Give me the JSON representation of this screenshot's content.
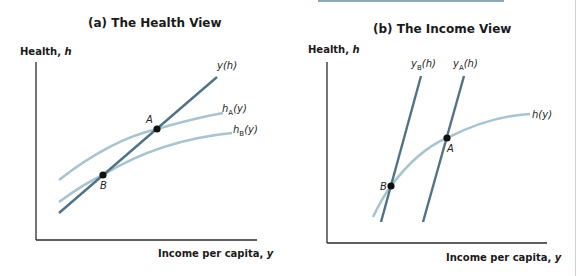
{
  "panel_a": {
    "title": "(a) The Health View",
    "y_axis_label": "Health, ",
    "y_axis_var": "h",
    "x_axis_label": "Income per capita, ",
    "x_axis_var": "y",
    "curves": {
      "y_of_h": {
        "label": "y(h)",
        "color": "#4f7385"
      },
      "h_A": {
        "label": "h",
        "sub": "A",
        "arg": "(y)",
        "color": "#a9c4cf"
      },
      "h_B": {
        "label": "h",
        "sub": "B",
        "arg": "(y)",
        "color": "#a9c4cf"
      }
    },
    "points": {
      "A": "A",
      "B": "B"
    }
  },
  "panel_b": {
    "title": "(b) The Income View",
    "y_axis_label": "Health, ",
    "y_axis_var": "h",
    "x_axis_label": "Income per capita, ",
    "x_axis_var": "y",
    "curves": {
      "y_B": {
        "label": "y",
        "sub": "B",
        "arg": "(h)",
        "color": "#4f7385"
      },
      "y_A": {
        "label": "y",
        "sub": "A",
        "arg": "(h)",
        "color": "#4f7385"
      },
      "h_of_y": {
        "label": "h(y)",
        "color": "#a9c4cf"
      }
    },
    "points": {
      "A": "A",
      "B": "B"
    }
  },
  "colors": {
    "axis": "#2a2a2a",
    "dark_line": "#4f7385",
    "light_line": "#a9c4cf",
    "point": "#111111"
  }
}
